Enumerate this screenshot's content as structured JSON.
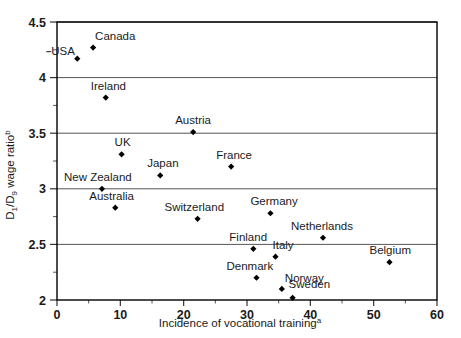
{
  "chart_data": {
    "type": "scatter",
    "title": "",
    "xlabel": "Incidence of vocational training",
    "xlabel_superscript": "a",
    "ylabel": "D1/D9 wage ratio",
    "ylabel_superscript": "b",
    "xlim": [
      0,
      60
    ],
    "ylim": [
      2,
      4.5
    ],
    "x_ticks": [
      0,
      10,
      20,
      30,
      40,
      50,
      60
    ],
    "x_tick_labels": [
      "0",
      "10",
      "20",
      "30",
      "40",
      "50",
      "60"
    ],
    "y_ticks": [
      2,
      2.5,
      3,
      3.5,
      4,
      4.5
    ],
    "y_tick_labels": [
      "2",
      "2.5",
      "3",
      "3.5",
      "4",
      "4.5"
    ],
    "y_minor_ticks": [
      2.25,
      2.75,
      3.25,
      3.75,
      4.25
    ],
    "gridlines": [
      2.5,
      3,
      3.5,
      4,
      4.5
    ],
    "grid": true,
    "legend": "none",
    "marker_style": "filled-diamond",
    "marker_color": "#000000",
    "points": [
      {
        "label": "USA",
        "x": 3.2,
        "y": 4.17,
        "label_dx": -26,
        "label_dy": -4,
        "leader": true
      },
      {
        "label": "Canada",
        "x": 5.7,
        "y": 4.27,
        "label_dx": 2,
        "label_dy": -8,
        "leader": false
      },
      {
        "label": "Ireland",
        "x": 7.7,
        "y": 3.82,
        "label_dx": -15,
        "label_dy": -8,
        "leader": false
      },
      {
        "label": "Austria",
        "x": 21.5,
        "y": 3.51,
        "label_dx": -18,
        "label_dy": -8,
        "leader": false
      },
      {
        "label": "UK",
        "x": 10.2,
        "y": 3.31,
        "label_dx": -7,
        "label_dy": -8,
        "leader": false
      },
      {
        "label": "Japan",
        "x": 16.3,
        "y": 3.12,
        "label_dx": -13,
        "label_dy": -8,
        "leader": false
      },
      {
        "label": "France",
        "x": 27.5,
        "y": 3.2,
        "label_dx": -15,
        "label_dy": -8,
        "leader": false
      },
      {
        "label": "New Zealand",
        "x": 7.1,
        "y": 3.0,
        "label_dx": -38,
        "label_dy": -8,
        "leader": false
      },
      {
        "label": "Australia",
        "x": 9.2,
        "y": 2.83,
        "label_dx": -26,
        "label_dy": -8,
        "leader": false
      },
      {
        "label": "Switzerland",
        "x": 22.2,
        "y": 2.73,
        "label_dx": -33,
        "label_dy": -8,
        "leader": false
      },
      {
        "label": "Germany",
        "x": 33.7,
        "y": 2.78,
        "label_dx": -20,
        "label_dy": -8,
        "leader": false
      },
      {
        "label": "Netherlands",
        "x": 42.0,
        "y": 2.56,
        "label_dx": -32,
        "label_dy": -8,
        "leader": false
      },
      {
        "label": "Finland",
        "x": 31.0,
        "y": 2.46,
        "label_dx": -24,
        "label_dy": -8,
        "leader": false
      },
      {
        "label": "Italy",
        "x": 34.5,
        "y": 2.39,
        "label_dx": -3,
        "label_dy": -8,
        "leader": false
      },
      {
        "label": "Belgium",
        "x": 52.5,
        "y": 2.34,
        "label_dx": -20,
        "label_dy": -8,
        "leader": false
      },
      {
        "label": "Denmark",
        "x": 31.5,
        "y": 2.2,
        "label_dx": -30,
        "label_dy": -8,
        "leader": false
      },
      {
        "label": "Norway",
        "x": 35.5,
        "y": 2.1,
        "label_dx": 3,
        "label_dy": -7,
        "leader": false
      },
      {
        "label": "Sweden",
        "x": 37.2,
        "y": 2.02,
        "label_dx": -4,
        "label_dy": -10,
        "leader": false
      }
    ]
  }
}
